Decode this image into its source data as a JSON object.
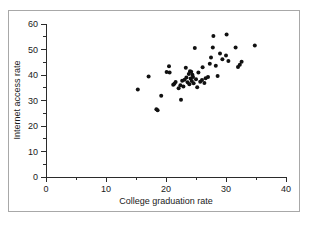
{
  "figure": {
    "caption_artifact": "",
    "frame_color": "#a8a8a8",
    "background": "#ffffff",
    "point_color": "#111111",
    "axis_color": "#2b2b2b"
  },
  "chart_data": {
    "type": "scatter",
    "title": "",
    "xlabel": "College graduation rate",
    "ylabel": "Internet access rate",
    "xlim": [
      0,
      40
    ],
    "ylim": [
      0,
      60
    ],
    "xticks": [
      0,
      10,
      20,
      30,
      40
    ],
    "yticks": [
      0,
      10,
      20,
      30,
      40,
      50,
      60
    ],
    "xtick_labels": [
      "0",
      "10",
      "20",
      "30",
      "40"
    ],
    "ytick_labels": [
      "0",
      "10",
      "20",
      "30",
      "40",
      "50",
      "60"
    ],
    "xminor_step": 5,
    "yminor_step": 5,
    "grid": false,
    "legend": false,
    "marker": "circle",
    "marker_size": 2,
    "n_points": 51,
    "points": [
      [
        15.3,
        34.3
      ],
      [
        17.1,
        39.4
      ],
      [
        18.4,
        26.6
      ],
      [
        18.6,
        26.2
      ],
      [
        19.2,
        31.9
      ],
      [
        20.1,
        41.2
      ],
      [
        20.5,
        43.4
      ],
      [
        20.6,
        41.0
      ],
      [
        21.2,
        36.2
      ],
      [
        21.4,
        36.6
      ],
      [
        21.6,
        37.3
      ],
      [
        22.1,
        34.8
      ],
      [
        22.4,
        36.0
      ],
      [
        22.5,
        30.3
      ],
      [
        22.7,
        37.7
      ],
      [
        22.9,
        35.5
      ],
      [
        23.1,
        38.1
      ],
      [
        23.3,
        42.8
      ],
      [
        23.4,
        39.0
      ],
      [
        23.6,
        37.2
      ],
      [
        23.8,
        40.4
      ],
      [
        23.9,
        36.4
      ],
      [
        24.0,
        41.5
      ],
      [
        24.1,
        38.6
      ],
      [
        24.2,
        41.3
      ],
      [
        24.3,
        37.6
      ],
      [
        24.4,
        40.1
      ],
      [
        24.5,
        39.2
      ],
      [
        24.6,
        36.8
      ],
      [
        24.8,
        50.6
      ],
      [
        25.0,
        38.3
      ],
      [
        25.2,
        35.2
      ],
      [
        25.4,
        41.0
      ],
      [
        25.7,
        37.4
      ],
      [
        26.0,
        38.0
      ],
      [
        26.1,
        43.0
      ],
      [
        26.4,
        36.9
      ],
      [
        26.6,
        38.7
      ],
      [
        27.0,
        39.2
      ],
      [
        27.3,
        44.4
      ],
      [
        27.5,
        46.9
      ],
      [
        27.8,
        50.8
      ],
      [
        27.9,
        55.3
      ],
      [
        28.3,
        43.6
      ],
      [
        28.6,
        39.6
      ],
      [
        29.0,
        48.4
      ],
      [
        29.4,
        46.2
      ],
      [
        30.0,
        47.6
      ],
      [
        30.1,
        55.9
      ],
      [
        30.4,
        45.5
      ],
      [
        31.6,
        50.8
      ],
      [
        32.0,
        43.1
      ],
      [
        32.3,
        44.0
      ],
      [
        32.6,
        45.2
      ],
      [
        34.8,
        51.6
      ]
    ]
  }
}
